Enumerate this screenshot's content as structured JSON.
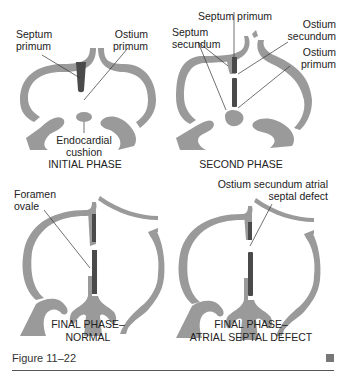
{
  "colors": {
    "wall": "#9a9a9a",
    "septum_primum": "#4a4a4a",
    "line": "#333333",
    "text": "#222222",
    "accent_square": "#777777"
  },
  "panels": [
    {
      "id": "initial",
      "caption_line1": "INITIAL PHASE",
      "labels": {
        "septum_primum": [
          "Septum",
          "primum"
        ],
        "ostium_primum": [
          "Ostium",
          "primum"
        ],
        "endocardial_cushion": [
          "Endocardial",
          "cushion"
        ]
      }
    },
    {
      "id": "second",
      "caption_line1": "SECOND PHASE",
      "labels": {
        "septum_primum": "Septum primum",
        "septum_secundum": [
          "Septum",
          "secundum"
        ],
        "ostium_secundum": [
          "Ostium",
          "secundum"
        ],
        "ostium_primum": [
          "Ostium",
          "primum"
        ]
      }
    },
    {
      "id": "final-normal",
      "caption_line1": "FINAL PHASE–",
      "caption_line2": "NORMAL",
      "labels": {
        "foramen_ovale": [
          "Foramen",
          "ovale"
        ]
      }
    },
    {
      "id": "final-asd",
      "caption_line1": "FINAL PHASE–",
      "caption_line2": "ATRIAL SEPTAL DEFECT",
      "labels": {
        "ostium_secundum_asd": [
          "Ostium secundum atrial",
          "septal defect"
        ]
      }
    }
  ],
  "footer": {
    "figure_label": "Figure 11–22"
  }
}
